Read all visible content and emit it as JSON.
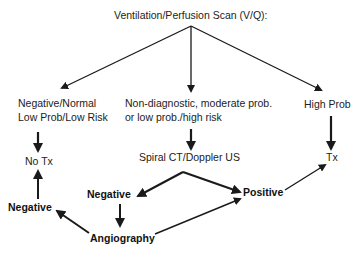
{
  "title": "Ventilation/Perfusion Scan (V/Q):",
  "nodes": {
    "neg_normal_line1": "Negative/Normal",
    "neg_normal_line2": "Low Prob/Low Risk",
    "nondiag_line1": "Non-diagnostic, moderate prob.",
    "nondiag_line2": "or low prob./high risk",
    "high_prob": "High Prob",
    "no_tx": "No Tx",
    "tx": "Tx",
    "spiral_ct": "Spiral CT/Doppler US",
    "negative_mid": "Negative",
    "negative_left": "Negative",
    "positive": "Positive",
    "angiography": "Angiography"
  },
  "edges": [
    {
      "from": "title",
      "to": "neg_normal"
    },
    {
      "from": "title",
      "to": "nondiag"
    },
    {
      "from": "title",
      "to": "high_prob"
    },
    {
      "from": "neg_normal",
      "to": "no_tx"
    },
    {
      "from": "nondiag",
      "to": "spiral_ct"
    },
    {
      "from": "high_prob",
      "to": "tx"
    },
    {
      "from": "spiral_ct",
      "to": "negative_mid"
    },
    {
      "from": "spiral_ct",
      "to": "positive"
    },
    {
      "from": "negative_mid",
      "to": "angiography"
    },
    {
      "from": "angiography",
      "to": "negative_left"
    },
    {
      "from": "angiography",
      "to": "positive"
    },
    {
      "from": "negative_left",
      "to": "no_tx"
    },
    {
      "from": "positive",
      "to": "tx"
    }
  ],
  "colors": {
    "line": "#1a1a1a",
    "background": "#ffffff"
  }
}
